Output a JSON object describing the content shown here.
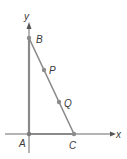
{
  "diagram": {
    "type": "coordinate-geometry",
    "axes": {
      "x_label": "x",
      "y_label": "y",
      "color": "#666666"
    },
    "points": [
      {
        "id": "A",
        "label": "A",
        "role": "origin"
      },
      {
        "id": "B",
        "label": "B",
        "role": "on y-axis"
      },
      {
        "id": "C",
        "label": "C",
        "role": "on x-axis"
      },
      {
        "id": "P",
        "label": "P",
        "role": "on segment BC"
      },
      {
        "id": "Q",
        "label": "Q",
        "role": "on segment BC"
      }
    ],
    "segments": [
      "AB",
      "BC",
      "AC"
    ],
    "colors": {
      "triangle": "#8a8a8a",
      "axis": "#6a6a6a",
      "point": "#8c8c8c",
      "label": "#3a3a3a"
    }
  }
}
